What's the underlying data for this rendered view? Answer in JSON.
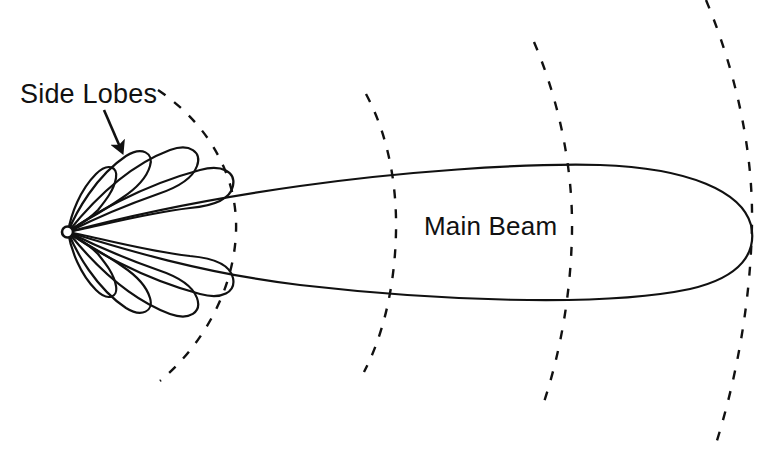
{
  "figure": {
    "type": "antenna-radiation-pattern",
    "background_color": "#ffffff",
    "stroke_color": "#111111",
    "width": 776,
    "height": 450
  },
  "labels": {
    "side_lobes": "Side Lobes",
    "main_beam": "Main Beam"
  },
  "annotations": {
    "arrow": {
      "name": "side-lobes-arrow",
      "from_x": 104,
      "from_y": 110,
      "to_x": 121,
      "to_y": 150
    }
  },
  "geometry": {
    "origin": {
      "x": 67,
      "y": 232,
      "radius": 5.5
    },
    "main_beam": {
      "tip_x": 753,
      "tip_y": 230,
      "upper_edge_peak_y": 163,
      "lower_edge_dip_y": 291,
      "half_width_at_x200": 28
    },
    "side_lobes_upper": [
      {
        "angle_deg": 66,
        "length": 66,
        "width": 15
      },
      {
        "angle_deg": 52,
        "length": 96,
        "width": 19
      },
      {
        "angle_deg": 36,
        "length": 138,
        "width": 24
      },
      {
        "angle_deg": 20,
        "length": 170,
        "width": 28
      }
    ],
    "side_lobes_lower": [
      {
        "angle_deg": -66,
        "length": 66,
        "width": 15
      },
      {
        "angle_deg": -52,
        "length": 96,
        "width": 19
      },
      {
        "angle_deg": -36,
        "length": 138,
        "width": 24
      },
      {
        "angle_deg": -20,
        "length": 170,
        "width": 28
      }
    ],
    "dashed_arcs": [
      {
        "name": "arc-1",
        "top_x": 158,
        "top_y": 90,
        "mid_x": 236,
        "mid_y": 232,
        "bottom_x": 160,
        "bottom_y": 381
      },
      {
        "name": "arc-2",
        "top_x": 366,
        "top_y": 94,
        "mid_x": 396,
        "mid_y": 232,
        "bottom_x": 364,
        "bottom_y": 372
      },
      {
        "name": "arc-3",
        "top_x": 534,
        "top_y": 42,
        "mid_x": 572,
        "mid_y": 232,
        "bottom_x": 544,
        "bottom_y": 402
      },
      {
        "name": "arc-4",
        "top_x": 706,
        "top_y": 0,
        "mid_x": 752,
        "mid_y": 222,
        "bottom_x": 714,
        "bottom_y": 450
      }
    ]
  }
}
